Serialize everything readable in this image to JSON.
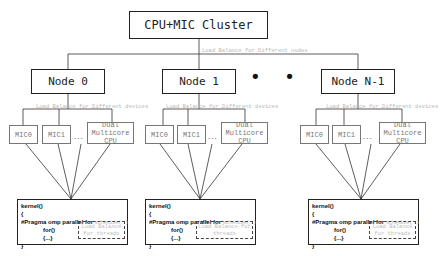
{
  "cluster": {
    "label": "CPU+MIC Cluster"
  },
  "cluster_balance_label": "Load Balance for Different nodes",
  "ellipsis_big": "• • •",
  "nodes": [
    {
      "label": "Node 0",
      "balance_label": "Load Balance for Different devices",
      "devices": [
        "MIC0",
        "MIC1",
        "Dual Multicore CPU"
      ],
      "device_dots": "...",
      "kernel": {
        "line1": "kernel()",
        "line2": "{",
        "pragma": "#Pragma omp parallel for ",
        "schedule": "schedule(...)",
        "for_line": "for()",
        "body_line": "{...}",
        "close": "}",
        "thread_balance": "Load Balance for threads"
      }
    },
    {
      "label": "Node 1",
      "balance_label": "Load Balance for Different devices",
      "devices": [
        "MIC0",
        "MIC1",
        "Dual Multicore CPU"
      ],
      "device_dots": "...",
      "kernel": {
        "line1": "kernel()",
        "line2": "{",
        "pragma": "#Pragma omp parallel for ",
        "schedule": "schedule(...)",
        "for_line": "for()",
        "body_line": "{...}",
        "close": "}",
        "thread_balance": "Load Balance for threads"
      }
    },
    {
      "label": "Node N-1",
      "balance_label": "Load Balance for Different devices",
      "devices": [
        "MIC0",
        "MIC1",
        "Dual Multicore CPU"
      ],
      "device_dots": "...",
      "kernel": {
        "line1": "kernel()",
        "line2": "{",
        "pragma": "#Pragma omp parallel for ",
        "schedule": "schedule(...)",
        "for_line": "for()",
        "body_line": "{...}",
        "close": "}",
        "thread_balance": "Load Balance for threads"
      }
    }
  ]
}
